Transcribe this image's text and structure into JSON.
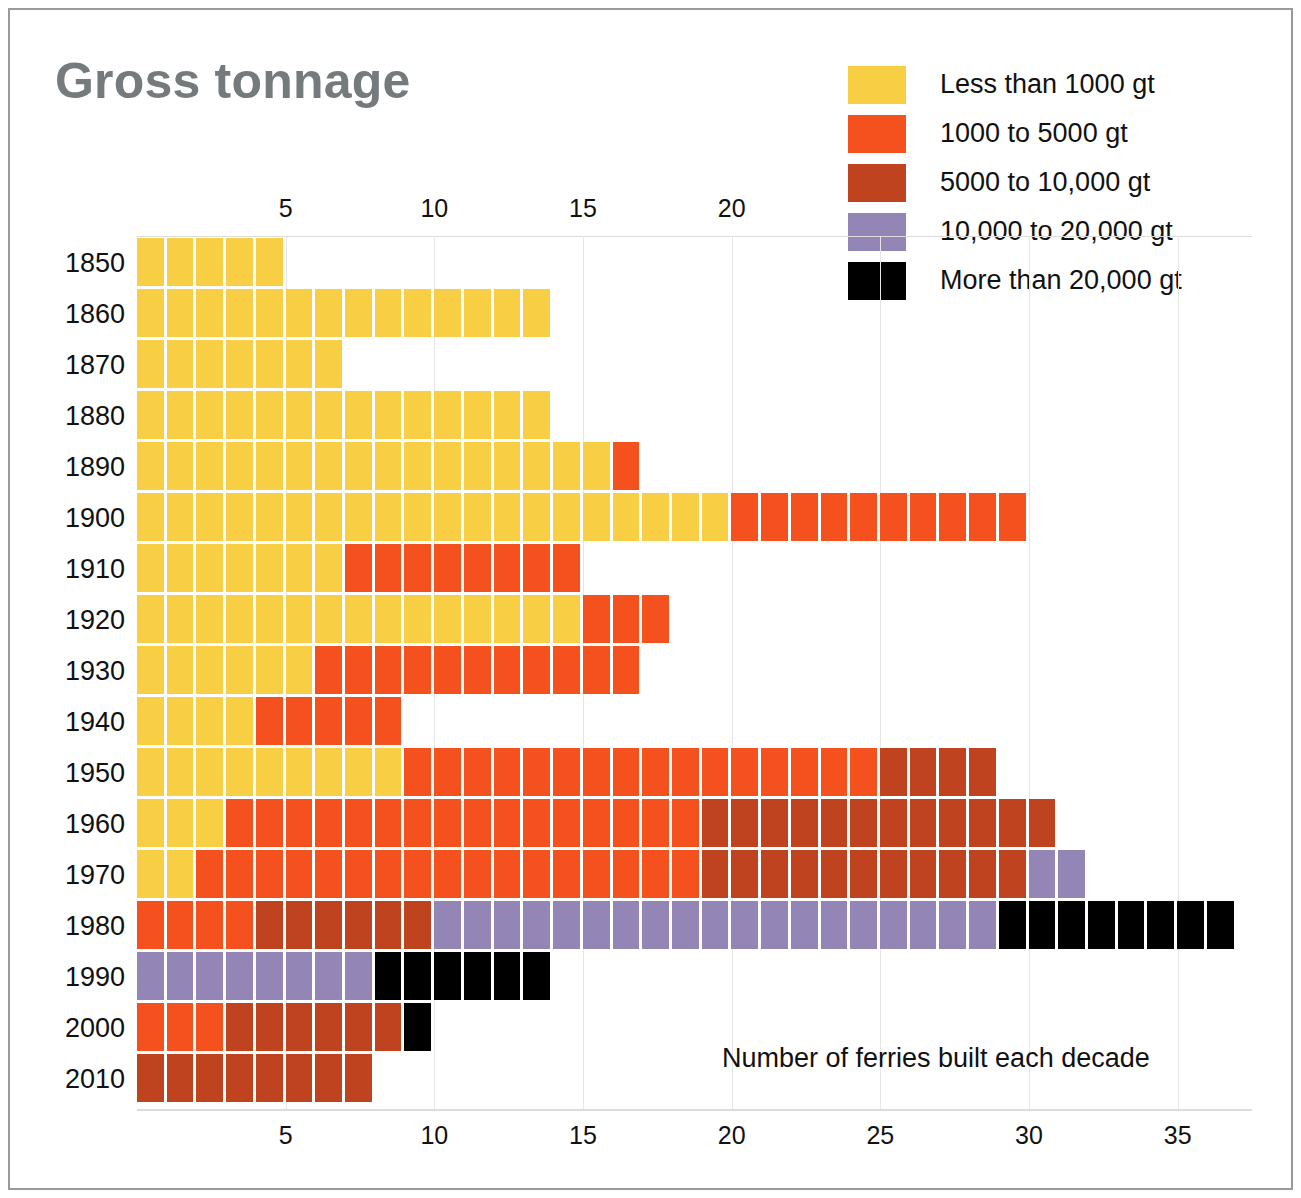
{
  "chart_data": {
    "type": "bar",
    "orientation": "horizontal-stacked",
    "title": "Gross tonnage",
    "xlabel": "Number of ferries built each decade",
    "ylabel": "",
    "xlim": [
      0,
      37.5
    ],
    "grid": true,
    "legend_position": "top-right",
    "xticks_top": [
      5,
      10,
      15,
      20
    ],
    "xticks_bottom": [
      5,
      10,
      15,
      20,
      25,
      30,
      35
    ],
    "categories": [
      "1850",
      "1860",
      "1870",
      "1880",
      "1890",
      "1900",
      "1910",
      "1920",
      "1930",
      "1940",
      "1950",
      "1960",
      "1970",
      "1980",
      "1990",
      "2000",
      "2010"
    ],
    "series": [
      {
        "name": "Less than 1000 gt",
        "color": "#f7ce44",
        "values": [
          5,
          14,
          7,
          14,
          16,
          20,
          7,
          15,
          6,
          4,
          9,
          3,
          2,
          0,
          0,
          0,
          0
        ]
      },
      {
        "name": "1000 to 5000 gt",
        "color": "#f4511e",
        "values": [
          0,
          0,
          0,
          0,
          1,
          10,
          8,
          3,
          11,
          5,
          16,
          16,
          17,
          4,
          0,
          3,
          0
        ]
      },
      {
        "name": "5000 to 10,000 gt",
        "color": "#c0431f",
        "values": [
          0,
          0,
          0,
          0,
          0,
          0,
          0,
          0,
          0,
          0,
          4,
          12,
          11,
          6,
          0,
          6,
          8
        ]
      },
      {
        "name": "10,000 to 20,000 gt",
        "color": "#9385b5",
        "values": [
          0,
          0,
          0,
          0,
          0,
          0,
          0,
          0,
          0,
          0,
          0,
          0,
          2,
          19,
          8,
          0,
          0
        ]
      },
      {
        "name": "More than 20,000 gt",
        "color": "#000000",
        "values": [
          0,
          0,
          0,
          0,
          0,
          0,
          0,
          0,
          0,
          0,
          0,
          0,
          0,
          8,
          6,
          1,
          0
        ]
      }
    ],
    "row_totals": [
      5,
      14,
      7,
      14,
      17,
      30,
      15,
      18,
      17,
      9,
      29,
      31,
      32,
      37,
      14,
      10,
      8
    ]
  },
  "legend": {
    "items": [
      {
        "label": "Less than 1000 gt",
        "color": "#f7ce44"
      },
      {
        "label": "1000 to 5000 gt",
        "color": "#f4511e"
      },
      {
        "label": "5000 to 10,000 gt",
        "color": "#c0431f"
      },
      {
        "label": "10,000 to 20,000 gt",
        "color": "#9385b5"
      },
      {
        "label": "More than 20,000 gt",
        "color": "#000000"
      }
    ]
  },
  "colors": {
    "title": "#757a7d",
    "frame": "#9a9a9a",
    "gridline": "#e6e6e6",
    "background": "#ffffff"
  }
}
